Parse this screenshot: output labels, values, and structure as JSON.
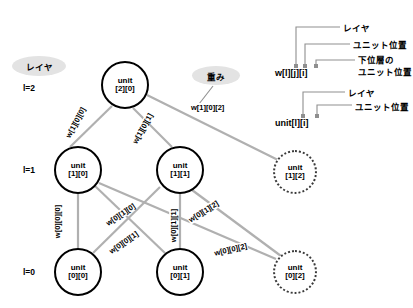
{
  "diagram": {
    "title_note": "",
    "layer_label_callout": "レイヤ",
    "weight_callout": "重み",
    "layers": [
      {
        "id": "l2",
        "label": "l=2"
      },
      {
        "id": "l1",
        "label": "l=1"
      },
      {
        "id": "l0",
        "label": "l=0"
      }
    ],
    "nodes": [
      {
        "id": "u20",
        "line1": "unit",
        "line2": "[2][0]",
        "style": "solid",
        "cx": 125,
        "cy": 85,
        "r": 24
      },
      {
        "id": "u10",
        "line1": "unit",
        "line2": "[1][0]",
        "style": "solid",
        "cx": 78,
        "cy": 170,
        "r": 24
      },
      {
        "id": "u11",
        "line1": "unit",
        "line2": "[1][1]",
        "style": "solid",
        "cx": 180,
        "cy": 170,
        "r": 24
      },
      {
        "id": "u12",
        "line1": "unit",
        "line2": "[1][2]",
        "style": "dotted",
        "cx": 295,
        "cy": 172,
        "r": 22
      },
      {
        "id": "u00",
        "line1": "unit",
        "line2": "[0][0]",
        "style": "solid",
        "cx": 78,
        "cy": 272,
        "r": 24
      },
      {
        "id": "u01",
        "line1": "unit",
        "line2": "[0][1]",
        "style": "solid",
        "cx": 180,
        "cy": 272,
        "r": 24
      },
      {
        "id": "u02",
        "line1": "unit",
        "line2": "[0][2]",
        "style": "dotted",
        "cx": 295,
        "cy": 272,
        "r": 22
      }
    ],
    "edges": [
      {
        "id": "e-w100",
        "from": "u20",
        "to": "u10",
        "label": "w[1][0][0]",
        "lx": 88,
        "ly": 125,
        "rot": -62
      },
      {
        "id": "e-w101",
        "from": "u20",
        "to": "u11",
        "label": "w[1][0][1]",
        "lx": 155,
        "ly": 131,
        "rot": -61
      },
      {
        "id": "e-w102",
        "from": "u20",
        "to": "u12",
        "label": "w[1][0][2]",
        "lx": 218,
        "ly": 108,
        "rot": 0
      },
      {
        "id": "e-w000",
        "from": "u10",
        "to": "u00",
        "label": "w[0][0][0]",
        "lx": 70,
        "ly": 222,
        "rot": -90
      },
      {
        "id": "e-w010",
        "from": "u11",
        "to": "u00",
        "label": "w[0][1][0]",
        "lx": 133,
        "ly": 215,
        "rot": -34
      },
      {
        "id": "e-w001",
        "from": "u10",
        "to": "u01",
        "label": "w[0][0][1]",
        "lx": 136,
        "ly": 243,
        "rot": -35
      },
      {
        "id": "e-w011",
        "from": "u11",
        "to": "u01",
        "label": "w[0][1][1]",
        "lx": 186,
        "ly": 226,
        "rot": -90
      },
      {
        "id": "e-w012",
        "from": "u11",
        "to": "u02",
        "label": "w[0][1][2]",
        "lx": 216,
        "ly": 212,
        "rot": -32
      },
      {
        "id": "e-w002",
        "from": "u10",
        "to": "u02",
        "label": "w[0][0][2]",
        "lx": 243,
        "ly": 250,
        "rot": -13
      }
    ],
    "legend": {
      "weight_formula": "w[l][j][i]",
      "weight_annotations": [
        {
          "id": "layer",
          "text": "レイヤ"
        },
        {
          "id": "unit-position",
          "text": "ユニット位置"
        },
        {
          "id": "lower-layer-unit-position-line1",
          "text": "下位層の"
        },
        {
          "id": "lower-layer-unit-position-line2",
          "text": "ユニット位置"
        }
      ],
      "unit_formula": "unit[l][i]",
      "unit_annotations": [
        {
          "id": "layer",
          "text": "レイヤ"
        },
        {
          "id": "unit-position",
          "text": "ユニット位置"
        }
      ]
    }
  }
}
